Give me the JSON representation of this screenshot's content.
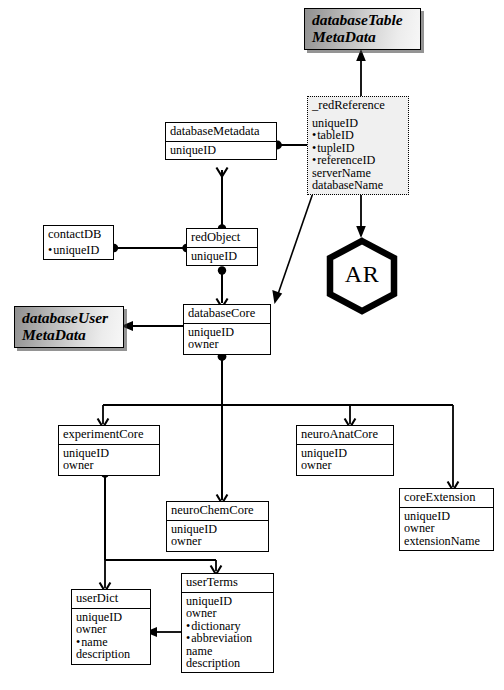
{
  "diagram": {
    "title_hidden": "",
    "palette": {
      "stroke": "#000000",
      "paper": "#ffffff",
      "meta_fill_light": "#f7f7f7",
      "meta_fill_dark": "#8f8f8f",
      "dashed_fill": "#f0f0f0"
    },
    "meta_boxes": [
      {
        "id": "databaseTableMetaData",
        "line1": "databaseTable",
        "line2": "MetaData"
      },
      {
        "id": "databaseUserMetaData",
        "line1": "databaseUser",
        "line2": "MetaData"
      }
    ],
    "process": {
      "id": "AR",
      "label": "AR",
      "shape": "hexagon"
    },
    "entities": [
      {
        "id": "redReference",
        "title": "_redReference",
        "style": "dashed",
        "attrs": [
          {
            "text": "uniqueID",
            "key": false
          },
          {
            "text": "tableID",
            "key": true
          },
          {
            "text": "tupleID",
            "key": true
          },
          {
            "text": "referenceID",
            "key": true
          },
          {
            "text": "serverName",
            "key": false
          },
          {
            "text": "databaseName",
            "key": false
          }
        ]
      },
      {
        "id": "databaseMetadata",
        "title": "databaseMetadata",
        "style": "solid",
        "attrs": [
          {
            "text": "uniqueID",
            "key": false
          }
        ]
      },
      {
        "id": "contactDB",
        "title": "contactDB",
        "style": "solid-nodivider",
        "attrs": [
          {
            "text": "uniqueID",
            "key": true
          }
        ]
      },
      {
        "id": "redObject",
        "title": "redObject",
        "style": "solid",
        "attrs": [
          {
            "text": "uniqueID",
            "key": false
          }
        ]
      },
      {
        "id": "databaseCore",
        "title": "databaseCore",
        "style": "solid",
        "attrs": [
          {
            "text": "uniqueID",
            "key": false
          },
          {
            "text": "owner",
            "key": false
          }
        ]
      },
      {
        "id": "experimentCore",
        "title": "experimentCore",
        "style": "solid",
        "attrs": [
          {
            "text": "uniqueID",
            "key": false
          },
          {
            "text": "owner",
            "key": false
          }
        ]
      },
      {
        "id": "neuroChemCore",
        "title": "neuroChemCore",
        "style": "solid",
        "attrs": [
          {
            "text": "uniqueID",
            "key": false
          },
          {
            "text": "owner",
            "key": false
          }
        ]
      },
      {
        "id": "neuroAnatCore",
        "title": "neuroAnatCore",
        "style": "solid",
        "attrs": [
          {
            "text": "uniqueID",
            "key": false
          },
          {
            "text": "owner",
            "key": false
          }
        ]
      },
      {
        "id": "coreExtension",
        "title": "coreExtension",
        "style": "solid",
        "attrs": [
          {
            "text": "uniqueID",
            "key": false
          },
          {
            "text": "owner",
            "key": false
          },
          {
            "text": "extensionName",
            "key": false
          }
        ]
      },
      {
        "id": "userDict",
        "title": "userDict",
        "style": "solid",
        "attrs": [
          {
            "text": "uniqueID",
            "key": false
          },
          {
            "text": "owner",
            "key": false
          },
          {
            "text": "name",
            "key": true
          },
          {
            "text": "description",
            "key": false
          }
        ]
      },
      {
        "id": "userTerms",
        "title": "userTerms",
        "style": "solid",
        "attrs": [
          {
            "text": "uniqueID",
            "key": false
          },
          {
            "text": "owner",
            "key": false
          },
          {
            "text": "dictionary",
            "key": true
          },
          {
            "text": "abbreviation",
            "key": true
          },
          {
            "text": "name",
            "key": false
          },
          {
            "text": "description",
            "key": false
          }
        ]
      }
    ],
    "relationships": [
      {
        "from": "redReference",
        "to": "databaseTableMetaData",
        "kind": "arrow-up"
      },
      {
        "from": "redReference",
        "to": "AR",
        "kind": "arrow-down"
      },
      {
        "from": "databaseMetadata",
        "to": "redReference",
        "kind": "dot-to-arrow"
      },
      {
        "from": "databaseMetadata",
        "to": "redObject",
        "kind": "dot-to-vee"
      },
      {
        "from": "contactDB",
        "to": "redObject",
        "kind": "dot-to-dot"
      },
      {
        "from": "redObject",
        "to": "databaseCore",
        "kind": "dot-to-vee"
      },
      {
        "from": "databaseCore",
        "to": "databaseUserMetaData",
        "kind": "arrow-left"
      },
      {
        "from": "redReference",
        "to": "databaseCore",
        "kind": "diagonal-arrow"
      },
      {
        "from": "databaseCore",
        "to": "experimentCore",
        "kind": "bus-vee"
      },
      {
        "from": "databaseCore",
        "to": "neuroChemCore",
        "kind": "bus-vee"
      },
      {
        "from": "databaseCore",
        "to": "neuroAnatCore",
        "kind": "bus-vee"
      },
      {
        "from": "databaseCore",
        "to": "coreExtension",
        "kind": "bus-vee"
      },
      {
        "from": "experimentCore",
        "to": "userDict",
        "kind": "bus-vee"
      },
      {
        "from": "experimentCore",
        "to": "userTerms",
        "kind": "bus-vee"
      },
      {
        "from": "userTerms",
        "to": "userDict",
        "kind": "arrow-left"
      }
    ]
  }
}
